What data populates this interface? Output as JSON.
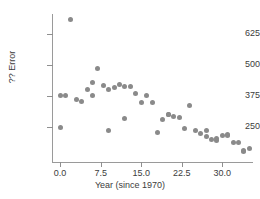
{
  "chart_data": {
    "type": "scatter",
    "title": "",
    "xlabel": "Year (since 1970)",
    "ylabel": "?? Error",
    "xlim": [
      -1.5,
      35.5
    ],
    "ylim": [
      110,
      705
    ],
    "xticks": [
      "0.0",
      "7.5",
      "15.0",
      "22.5",
      "30.0"
    ],
    "xtick_values": [
      0.0,
      7.5,
      15.0,
      22.5,
      30.0
    ],
    "yticks": [
      "250",
      "375",
      "500",
      "625"
    ],
    "ytick_values": [
      250,
      375,
      500,
      625
    ],
    "grid": false,
    "legend": null,
    "marker": {
      "color": "#8a8a8a",
      "shape": "circle",
      "size": 5
    },
    "x": [
      0,
      0,
      1,
      2,
      3,
      4,
      5,
      6,
      6,
      7,
      8,
      9,
      9,
      10,
      11,
      12,
      12,
      13,
      14,
      15,
      16,
      17,
      18,
      19,
      20,
      20,
      21,
      22,
      23,
      24,
      25,
      26,
      27,
      27,
      28,
      29,
      29,
      30,
      31,
      31,
      32,
      33,
      34,
      34,
      35
    ],
    "y": [
      250,
      378,
      377,
      683,
      360,
      352,
      403,
      379,
      428,
      486,
      417,
      238,
      402,
      408,
      420,
      414,
      283,
      415,
      384,
      348,
      378,
      350,
      228,
      281,
      299,
      301,
      292,
      288,
      246,
      338,
      238,
      225,
      213,
      238,
      202,
      198,
      206,
      218,
      222,
      216,
      190,
      189,
      152,
      156,
      163
    ],
    "n_points": 45,
    "series": [
      {
        "name": "error-by-year",
        "points": [
          [
            0,
            250
          ],
          [
            0,
            378
          ],
          [
            1,
            377
          ],
          [
            2,
            683
          ],
          [
            3,
            360
          ],
          [
            4,
            352
          ],
          [
            5,
            403
          ],
          [
            6,
            379
          ],
          [
            6,
            428
          ],
          [
            7,
            486
          ],
          [
            8,
            417
          ],
          [
            9,
            238
          ],
          [
            9,
            402
          ],
          [
            10,
            408
          ],
          [
            11,
            420
          ],
          [
            12,
            414
          ],
          [
            12,
            283
          ],
          [
            13,
            415
          ],
          [
            14,
            384
          ],
          [
            15,
            348
          ],
          [
            16,
            378
          ],
          [
            17,
            350
          ],
          [
            18,
            228
          ],
          [
            19,
            281
          ],
          [
            20,
            299
          ],
          [
            20,
            301
          ],
          [
            21,
            292
          ],
          [
            22,
            288
          ],
          [
            23,
            246
          ],
          [
            24,
            338
          ],
          [
            25,
            238
          ],
          [
            26,
            225
          ],
          [
            27,
            213
          ],
          [
            27,
            238
          ],
          [
            28,
            202
          ],
          [
            29,
            198
          ],
          [
            29,
            206
          ],
          [
            30,
            218
          ],
          [
            31,
            222
          ],
          [
            31,
            216
          ],
          [
            32,
            190
          ],
          [
            33,
            189
          ],
          [
            34,
            152
          ],
          [
            34,
            156
          ],
          [
            35,
            163
          ]
        ]
      }
    ]
  }
}
